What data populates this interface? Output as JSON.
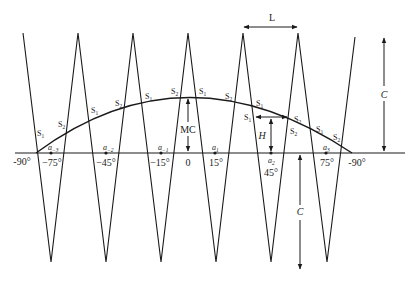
{
  "diagram": {
    "type": "zigzag-over-arc",
    "line_color": "#1a1a1a",
    "zigzag": {
      "top_y": 33,
      "bottom_y": 262,
      "points": [
        [
          23,
          33
        ],
        [
          51,
          262
        ],
        [
          78,
          33
        ],
        [
          106,
          262
        ],
        [
          133,
          33
        ],
        [
          161,
          262
        ],
        [
          188,
          33
        ],
        [
          216,
          262
        ],
        [
          243,
          33
        ],
        [
          271,
          262
        ],
        [
          298,
          33
        ],
        [
          327,
          262
        ],
        [
          355,
          37
        ]
      ]
    },
    "baseline": {
      "y": 153,
      "x_start": 15,
      "x_end": 405
    },
    "arc": {
      "start": [
        36,
        153
      ],
      "peak": [
        186,
        97
      ],
      "end": [
        352,
        153
      ]
    },
    "labels": {
      "L": "L",
      "C_top": "C",
      "C_bottom": "C",
      "H": "H",
      "MC": "MC",
      "deg_left_end": "-90°",
      "deg_right_end": "-90°",
      "ticks": [
        {
          "a": "a",
          "sub": "−3",
          "deg": "−75°"
        },
        {
          "a": "a",
          "sub": "−2",
          "deg": "−45°"
        },
        {
          "a": "a",
          "sub": "−1",
          "deg": "−15°"
        },
        {
          "a": "",
          "sub": "",
          "deg": "0"
        },
        {
          "a": "a",
          "sub": "1",
          "deg": "15°"
        },
        {
          "a": "a",
          "sub": "2",
          "deg": "45°"
        },
        {
          "a": "a",
          "sub": "3",
          "deg": "75°"
        }
      ],
      "s_labels": [
        {
          "t": "S",
          "sub": "1"
        },
        {
          "t": "S",
          "sub": "2"
        },
        {
          "t": "S",
          "sub": "1"
        },
        {
          "t": "S",
          "sub": "2"
        },
        {
          "t": "S",
          "sub": "1"
        },
        {
          "t": "S",
          "sub": "2"
        },
        {
          "t": "S",
          "sub": "1"
        },
        {
          "t": "S",
          "sub": "2"
        },
        {
          "t": "S",
          "sub": "1"
        },
        {
          "t": "S",
          "sub": "1"
        },
        {
          "t": "S",
          "sub": "2"
        },
        {
          "t": "S",
          "sub": "2"
        },
        {
          "t": "S",
          "sub": "1"
        },
        {
          "t": "S",
          "sub": "2"
        }
      ]
    }
  }
}
